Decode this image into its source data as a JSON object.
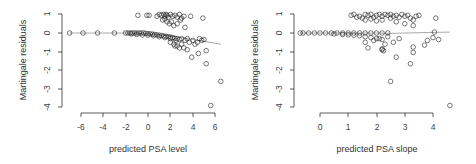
{
  "chart_data": [
    {
      "type": "scatter",
      "title": "",
      "xlabel": "predicted PSA level",
      "ylabel": "Martingale residuals",
      "xlim": [
        -7,
        6.6
      ],
      "ylim": [
        -4,
        1
      ],
      "xticks": [
        -6,
        -4,
        -2,
        0,
        2,
        4,
        6
      ],
      "yticks": [
        -4,
        -3,
        -2,
        -1,
        0,
        1
      ],
      "grid": false,
      "smoother": {
        "color": "#aaaaaa",
        "x": [
          -7,
          -2,
          0,
          2,
          3,
          4,
          5,
          6.5
        ],
        "y": [
          0,
          0,
          -0.05,
          -0.15,
          -0.25,
          -0.35,
          -0.45,
          -0.6
        ]
      },
      "points": {
        "x": [
          -7.0,
          -5.8,
          -4.5,
          -3.0,
          -2.0,
          -1.8,
          -1.6,
          -1.4,
          -1.2,
          -1.0,
          -0.8,
          -0.6,
          -0.4,
          -0.2,
          0.0,
          0.2,
          0.4,
          0.6,
          0.8,
          1.0,
          1.2,
          1.4,
          1.6,
          1.8,
          2.0,
          2.2,
          2.4,
          2.6,
          2.8,
          3.0,
          -1.5,
          -1.0,
          -0.5,
          0.0,
          0.5,
          1.0,
          1.5,
          2.0,
          2.5,
          -0.9,
          -0.1,
          0.1,
          0.8,
          1.0,
          1.2,
          1.4,
          1.5,
          1.6,
          1.7,
          1.8,
          2.0,
          2.2,
          2.4,
          2.6,
          2.8,
          3.0,
          3.2,
          1.3,
          1.5,
          1.7,
          1.9,
          2.1,
          2.3,
          2.6,
          2.9,
          3.3,
          3.8,
          4.9,
          2.0,
          2.3,
          2.6,
          3.0,
          3.3,
          3.5,
          3.7,
          4.0,
          4.2,
          4.4,
          4.6,
          4.8,
          5.0,
          3.2,
          3.5,
          3.9,
          4.5,
          5.2,
          5.2,
          6.5,
          5.6,
          2.4,
          2.8
        ],
        "y": [
          0,
          0,
          0,
          0,
          0,
          0,
          0,
          0,
          0,
          0,
          0,
          0,
          0,
          -0.02,
          -0.03,
          -0.05,
          -0.06,
          -0.08,
          -0.1,
          -0.12,
          -0.14,
          -0.16,
          -0.18,
          -0.2,
          -0.22,
          -0.25,
          -0.28,
          -0.3,
          -0.35,
          -0.3,
          -0.05,
          -0.08,
          -0.1,
          -0.12,
          -0.15,
          -0.2,
          -0.25,
          -0.3,
          -0.4,
          0.95,
          0.95,
          0.95,
          0.9,
          1.0,
          0.95,
          1.0,
          0.9,
          1.0,
          0.95,
          0.85,
          1.0,
          0.9,
          0.95,
          0.85,
          1.0,
          0.8,
          0.9,
          0.7,
          0.75,
          0.6,
          0.5,
          0.6,
          0.4,
          0.5,
          0.7,
          0.3,
          0.9,
          0.8,
          -0.5,
          -0.6,
          -0.7,
          -0.6,
          -0.4,
          -0.3,
          -0.5,
          -0.4,
          -0.6,
          -0.5,
          -0.3,
          -0.4,
          -0.35,
          -0.8,
          -0.9,
          -1.3,
          -1.1,
          -0.95,
          -1.65,
          -2.6,
          -3.9,
          -0.7,
          -0.8
        ]
      }
    },
    {
      "type": "scatter",
      "title": "",
      "xlabel": "predicted PSA slope",
      "ylabel": "Martingale residuals",
      "xlim": [
        -0.8,
        4.7
      ],
      "ylim": [
        -4,
        1
      ],
      "xticks": [
        0,
        1,
        2,
        3,
        4
      ],
      "yticks": [
        -4,
        -3,
        -2,
        -1,
        0,
        1
      ],
      "grid": false,
      "smoother": {
        "color": "#aaaaaa",
        "x": [
          -0.7,
          1,
          2,
          2.5,
          3,
          4,
          4.6
        ],
        "y": [
          0,
          0,
          0,
          -0.02,
          0,
          0.03,
          0.05
        ]
      },
      "points": {
        "x": [
          -0.7,
          -0.6,
          -0.4,
          -0.2,
          0.0,
          0.2,
          0.4,
          0.6,
          0.8,
          1.0,
          1.2,
          1.4,
          1.6,
          1.8,
          2.0,
          2.2,
          2.4,
          0.5,
          0.8,
          1.0,
          1.2,
          1.4,
          1.6,
          1.8,
          2.0,
          2.2,
          1.1,
          1.2,
          1.3,
          1.4,
          1.5,
          1.6,
          1.7,
          1.8,
          1.9,
          2.0,
          2.1,
          2.2,
          2.3,
          2.4,
          2.5,
          2.6,
          2.7,
          2.8,
          2.9,
          3.0,
          3.1,
          3.2,
          3.3,
          3.4,
          3.5,
          1.6,
          1.8,
          2.0,
          2.2,
          2.5,
          2.7,
          3.0,
          3.3,
          4.1,
          1.6,
          1.7,
          1.9,
          2.1,
          2.2,
          2.3,
          2.4,
          2.6,
          2.8,
          2.2,
          2.25,
          2.7,
          3.3,
          3.3,
          3.2,
          3.7,
          3.8,
          4.0,
          4.05,
          4.2,
          2.5,
          4.6
        ],
        "y": [
          0,
          0,
          0,
          0,
          0,
          0,
          0,
          0,
          0,
          0,
          0,
          0,
          0,
          0,
          0,
          0,
          0,
          -0.05,
          -0.08,
          -0.1,
          -0.12,
          -0.15,
          -0.2,
          -0.25,
          -0.3,
          -0.35,
          0.95,
          1.0,
          0.85,
          0.9,
          0.8,
          1.0,
          0.95,
          1.0,
          0.85,
          0.95,
          1.0,
          0.9,
          1.0,
          0.95,
          1.0,
          0.9,
          0.95,
          0.85,
          1.0,
          0.9,
          0.95,
          0.8,
          0.7,
          0.9,
          0.95,
          0.7,
          0.75,
          0.65,
          0.7,
          0.8,
          0.6,
          0.5,
          0.4,
          0.8,
          -0.5,
          -0.8,
          -0.4,
          -0.3,
          -0.9,
          -0.6,
          -0.2,
          -0.5,
          -0.3,
          -0.85,
          -0.95,
          -1.3,
          -0.75,
          -1.05,
          -1.65,
          -0.65,
          -0.4,
          -0.25,
          0.05,
          -0.35,
          -2.6,
          -3.9
        ]
      }
    }
  ],
  "panels": [
    {
      "xlabel": "predicted PSA level",
      "ylabel": "Martingale residuals",
      "xticks": [
        "-6",
        "-4",
        "-2",
        "0",
        "2",
        "4",
        "6"
      ],
      "yticks": [
        "1",
        "0",
        "-1",
        "-2",
        "-3",
        "-4"
      ]
    },
    {
      "xlabel": "predicted PSA slope",
      "ylabel": "Martingale residuals",
      "xticks": [
        "0",
        "1",
        "2",
        "3",
        "4"
      ],
      "yticks": [
        "1",
        "0",
        "-1",
        "-2",
        "-3",
        "-4"
      ]
    }
  ]
}
